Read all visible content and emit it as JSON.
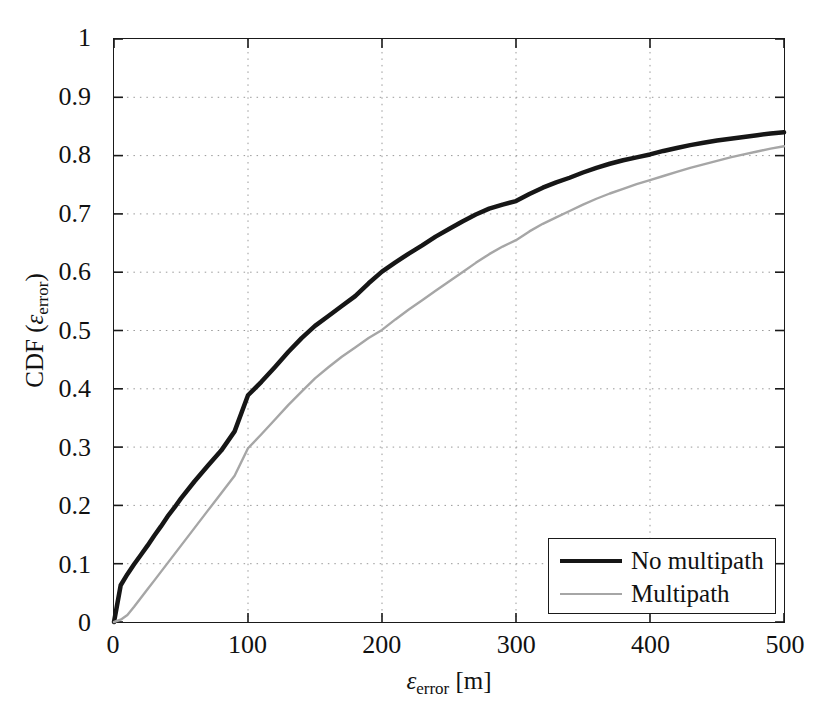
{
  "chart_data": {
    "type": "line",
    "title": "",
    "subtitle": "",
    "xlabel": "ε_error [m]",
    "ylabel": "CDF (ε_error)",
    "xlim": [
      0,
      500
    ],
    "ylim": [
      0,
      1
    ],
    "grid": true,
    "grid_style": "dotted",
    "xticks": [
      0,
      100,
      200,
      300,
      400,
      500
    ],
    "xtick_labels": [
      "0",
      "100",
      "200",
      "300",
      "400",
      "500"
    ],
    "yticks": [
      0,
      0.1,
      0.2,
      0.3,
      0.4,
      0.5,
      0.6,
      0.7,
      0.8,
      0.9,
      1
    ],
    "ytick_labels": [
      "0",
      "0.1",
      "0.2",
      "0.3",
      "0.4",
      "0.5",
      "0.6",
      "0.7",
      "0.8",
      "0.9",
      "1"
    ],
    "legend_position": "lower right",
    "x": [
      0,
      5,
      10,
      15,
      20,
      25,
      30,
      35,
      40,
      45,
      50,
      60,
      70,
      80,
      90,
      100,
      110,
      120,
      130,
      140,
      150,
      160,
      170,
      180,
      190,
      200,
      210,
      220,
      230,
      240,
      250,
      260,
      270,
      280,
      290,
      300,
      310,
      320,
      330,
      340,
      350,
      360,
      370,
      380,
      390,
      400,
      410,
      420,
      430,
      440,
      450,
      460,
      470,
      480,
      490,
      500
    ],
    "series": [
      {
        "name": "No multipath",
        "color": "#161616",
        "width": 4.5,
        "values": [
          0.0,
          0.063,
          0.082,
          0.099,
          0.115,
          0.131,
          0.148,
          0.164,
          0.181,
          0.196,
          0.212,
          0.241,
          0.268,
          0.294,
          0.327,
          0.389,
          0.412,
          0.437,
          0.463,
          0.487,
          0.508,
          0.525,
          0.542,
          0.559,
          0.581,
          0.601,
          0.617,
          0.632,
          0.646,
          0.661,
          0.674,
          0.687,
          0.699,
          0.709,
          0.716,
          0.722,
          0.734,
          0.745,
          0.754,
          0.762,
          0.771,
          0.779,
          0.786,
          0.792,
          0.797,
          0.802,
          0.808,
          0.813,
          0.818,
          0.822,
          0.826,
          0.829,
          0.832,
          0.835,
          0.838,
          0.84
        ]
      },
      {
        "name": "Multipath",
        "color": "#a6a6a6",
        "width": 2.4,
        "values": [
          0.0,
          0.004,
          0.012,
          0.026,
          0.041,
          0.056,
          0.071,
          0.086,
          0.101,
          0.116,
          0.131,
          0.161,
          0.191,
          0.221,
          0.251,
          0.298,
          0.322,
          0.347,
          0.372,
          0.395,
          0.418,
          0.437,
          0.455,
          0.471,
          0.487,
          0.501,
          0.519,
          0.536,
          0.552,
          0.568,
          0.584,
          0.6,
          0.616,
          0.631,
          0.644,
          0.655,
          0.67,
          0.683,
          0.694,
          0.705,
          0.716,
          0.726,
          0.735,
          0.743,
          0.751,
          0.758,
          0.765,
          0.772,
          0.779,
          0.785,
          0.791,
          0.797,
          0.802,
          0.807,
          0.812,
          0.816
        ]
      }
    ]
  },
  "axes": {
    "x_title_prefix": "ε",
    "x_title_sub": "error",
    "x_title_suffix": " [m]",
    "y_title_prefix": "CDF (",
    "y_title_symbol": "ε",
    "y_title_sub": "error",
    "y_title_suffix": ")"
  },
  "legend": {
    "items": [
      {
        "label": "No multipath",
        "style": "thick"
      },
      {
        "label": "Multipath",
        "style": "thin"
      }
    ]
  }
}
